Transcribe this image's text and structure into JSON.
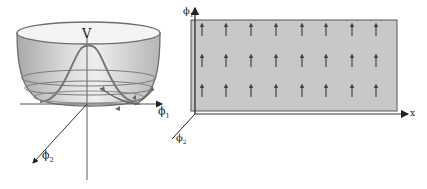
{
  "left_diagram": {
    "title": "Mexican hat potential",
    "labels": {
      "potential": "V",
      "axis_x": "ϕ",
      "axis_x_sub": "1",
      "axis_z": "ϕ",
      "axis_z_sub": "2"
    },
    "colors": {
      "bowl_fill": "#cfcfcf",
      "bowl_stroke": "#6e6e6e",
      "axis": "#333333"
    }
  },
  "right_diagram": {
    "title": "Field configuration",
    "labels": {
      "axis_y": "ϕ",
      "axis_y_sub": "1",
      "axis_x": "x",
      "axis_z": "ϕ",
      "axis_z_sub": "2"
    },
    "grid": {
      "rows": 3,
      "cols": 8,
      "arrow_direction": "up"
    },
    "colors": {
      "plane_fill": "#c8c8c8",
      "plane_stroke": "#555555",
      "arrow": "#444444",
      "axis": "#222222"
    }
  }
}
